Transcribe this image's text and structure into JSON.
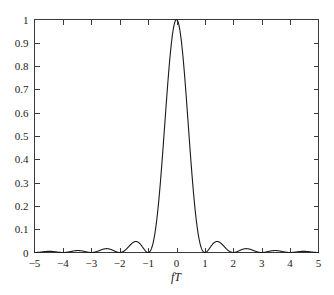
{
  "chart_data": {
    "type": "line",
    "title": "",
    "subtitle": "",
    "xlabel": "fT",
    "ylabel": "",
    "xlim": [
      -5,
      5
    ],
    "ylim": [
      0,
      1
    ],
    "grid": false,
    "legend": null,
    "annotations": [],
    "x_ticks": [
      -5,
      -4,
      -3,
      -2,
      -1,
      0,
      1,
      2,
      3,
      4,
      5
    ],
    "x_tick_labels": [
      "−5",
      "−4",
      "−3",
      "−2",
      "−1",
      "0",
      "1",
      "2",
      "3",
      "4",
      "5"
    ],
    "y_ticks": [
      0,
      0.1,
      0.2,
      0.3,
      0.4,
      0.5,
      0.6,
      0.7,
      0.8,
      0.9,
      1
    ],
    "y_tick_labels": [
      "0",
      "0.1",
      "0.2",
      "0.3",
      "0.4",
      "0.5",
      "0.6",
      "0.7",
      "0.8",
      "0.9",
      "1"
    ],
    "series": [
      {
        "name": "sinc-squared",
        "color": "#1a1a1a",
        "formula": "(sin(pi*x)/(pi*x))^2",
        "x": [
          -5,
          -4.9,
          -4.8,
          -4.7,
          -4.6,
          -4.5,
          -4.4,
          -4.3,
          -4.2,
          -4.1,
          -4,
          -3.9,
          -3.8,
          -3.7,
          -3.6,
          -3.5,
          -3.4,
          -3.3,
          -3.2,
          -3.1,
          -3,
          -2.9,
          -2.8,
          -2.7,
          -2.6,
          -2.5,
          -2.4,
          -2.3,
          -2.2,
          -2.1,
          -2,
          -1.9,
          -1.8,
          -1.7,
          -1.6,
          -1.5,
          -1.4,
          -1.3,
          -1.2,
          -1.1,
          -1,
          -0.9,
          -0.8,
          -0.7,
          -0.6,
          -0.5,
          -0.4,
          -0.3,
          -0.2,
          -0.1,
          0,
          0.1,
          0.2,
          0.3,
          0.4,
          0.5,
          0.6,
          0.7,
          0.8,
          0.9,
          1,
          1.1,
          1.2,
          1.3,
          1.4,
          1.5,
          1.6,
          1.7,
          1.8,
          1.9,
          2,
          2.1,
          2.2,
          2.3,
          2.4,
          2.5,
          2.6,
          2.7,
          2.8,
          2.9,
          3,
          3.1,
          3.2,
          3.3,
          3.4,
          3.5,
          3.6,
          3.7,
          3.8,
          3.9,
          4,
          4.1,
          4.2,
          4.3,
          4.4,
          4.5,
          4.6,
          4.7,
          4.8,
          4.9,
          5
        ],
        "y": [
          0,
          0.001,
          0.004,
          0.007,
          0.009,
          0.01,
          0.009,
          0.007,
          0.004,
          0.001,
          0,
          0.001,
          0.005,
          0.01,
          0.013,
          0.016,
          0.014,
          0.01,
          0.005,
          0.001,
          0,
          0.002,
          0.008,
          0.015,
          0.022,
          0.026,
          0.023,
          0.016,
          0.008,
          0.002,
          0,
          0.003,
          0.014,
          0.029,
          0.042,
          0.05,
          0.045,
          0.031,
          0.015,
          0.004,
          0,
          0.012,
          0.055,
          0.135,
          0.255,
          0.405,
          0.572,
          0.735,
          0.875,
          0.968,
          1,
          0.968,
          0.875,
          0.735,
          0.572,
          0.405,
          0.255,
          0.135,
          0.055,
          0.012,
          0,
          0.004,
          0.015,
          0.031,
          0.045,
          0.05,
          0.042,
          0.029,
          0.014,
          0.003,
          0,
          0.002,
          0.008,
          0.016,
          0.023,
          0.026,
          0.022,
          0.015,
          0.008,
          0.002,
          0,
          0.001,
          0.005,
          0.01,
          0.014,
          0.016,
          0.013,
          0.01,
          0.005,
          0.001,
          0,
          0.001,
          0.004,
          0.007,
          0.009,
          0.01,
          0.009,
          0.007,
          0.004,
          0.001,
          0
        ],
        "peak_value": 1,
        "peak_x": 0,
        "first_null_x": [
          -1,
          1
        ],
        "first_sidelobe_peak": 0.047,
        "first_sidelobe_x": [
          -1.43,
          1.43
        ]
      }
    ]
  },
  "figure": {
    "background_color": "#ffffff",
    "frame_color": "#3a3a3a",
    "curve_color": "#1a1a1a"
  }
}
